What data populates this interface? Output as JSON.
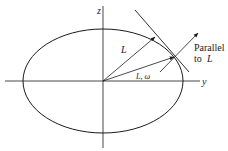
{
  "diagram": {
    "type": "inertia-ellipsoid-cross-section",
    "axes": {
      "vertical_label": "z",
      "horizontal_label": "y"
    },
    "vectors": {
      "angular_momentum_label": "L",
      "omega_label": "L, ω"
    },
    "annotation": {
      "line1": "Parallel",
      "line2": "to",
      "line2_symbol": "L"
    },
    "colors": {
      "stroke": "#1a1a1a",
      "background": "#ffffff"
    }
  }
}
